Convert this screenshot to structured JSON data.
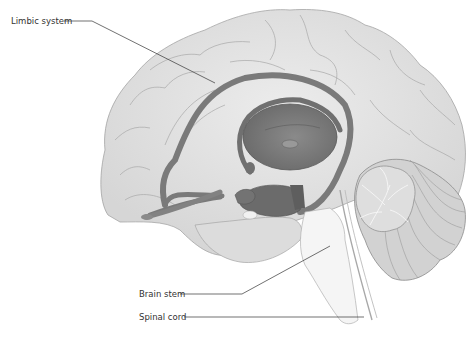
{
  "diagram": {
    "type": "anatomical-illustration",
    "labels": [
      {
        "id": "limbic-system",
        "text": "Limbic system",
        "x": 11,
        "y": 16
      },
      {
        "id": "brain-stem",
        "text": "Brain stem",
        "x": 139,
        "y": 290
      },
      {
        "id": "spinal-cord",
        "text": "Spinal cord",
        "x": 139,
        "y": 313
      }
    ],
    "colors": {
      "cortex_fill": "#e3e3e3",
      "cortex_stroke": "#9a9a9a",
      "limbic_fill": "#7d7d7d",
      "limbic_dark": "#666666",
      "stem_fill": "#f4f4f4",
      "cerebellum_fill": "#cfcfcf",
      "leader_line": "#333333"
    }
  }
}
